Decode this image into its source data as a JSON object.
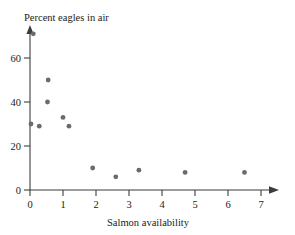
{
  "chart_data": {
    "type": "scatter",
    "title": "Percent eagles in air",
    "xlabel": "Salmon availability",
    "ylabel": "Percent eagles in air",
    "xlim": [
      0,
      7.4
    ],
    "ylim": [
      0,
      74
    ],
    "xticks": [
      0,
      1,
      2,
      3,
      4,
      5,
      6,
      7
    ],
    "xticklabels": [
      "0",
      "1",
      "2",
      "3",
      "4",
      "5",
      "6",
      "7"
    ],
    "yticks": [
      0,
      20,
      40,
      60
    ],
    "yticklabels": [
      "0",
      "20",
      "40",
      "60"
    ],
    "grid": false,
    "legend": false,
    "marker_color": "#6b6b6b",
    "axis_color": "#3c3c3c",
    "points": [
      {
        "x": 0.1,
        "y": 71
      },
      {
        "x": 0.03,
        "y": 30
      },
      {
        "x": 0.28,
        "y": 29
      },
      {
        "x": 0.55,
        "y": 50
      },
      {
        "x": 0.53,
        "y": 40
      },
      {
        "x": 1.0,
        "y": 33
      },
      {
        "x": 1.18,
        "y": 29
      },
      {
        "x": 1.9,
        "y": 10
      },
      {
        "x": 2.6,
        "y": 6
      },
      {
        "x": 3.3,
        "y": 9
      },
      {
        "x": 4.7,
        "y": 8
      },
      {
        "x": 6.5,
        "y": 8
      }
    ]
  }
}
